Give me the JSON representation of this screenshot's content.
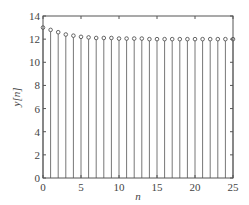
{
  "chart_data": {
    "type": "stem",
    "title": "",
    "xlabel": "n",
    "ylabel": "y[n]",
    "xlim": [
      0,
      25
    ],
    "ylim": [
      0,
      14
    ],
    "grid": false,
    "legend": null,
    "x_ticks": [
      0,
      5,
      10,
      15,
      20,
      25
    ],
    "y_ticks": [
      0,
      2,
      4,
      6,
      8,
      10,
      12,
      14
    ],
    "x": [
      0,
      1,
      2,
      3,
      4,
      5,
      6,
      7,
      8,
      9,
      10,
      11,
      12,
      13,
      14,
      15,
      16,
      17,
      18,
      19,
      20,
      21,
      22,
      23,
      24,
      25
    ],
    "values": [
      13.0,
      12.8,
      12.6,
      12.4,
      12.3,
      12.2,
      12.15,
      12.1,
      12.1,
      12.1,
      12.05,
      12.05,
      12.05,
      12.05,
      12.0,
      12.0,
      12.0,
      12.0,
      12.0,
      12.0,
      12.0,
      12.0,
      12.0,
      12.0,
      12.0,
      12.0
    ],
    "marker": "circle",
    "color": "#777777"
  }
}
